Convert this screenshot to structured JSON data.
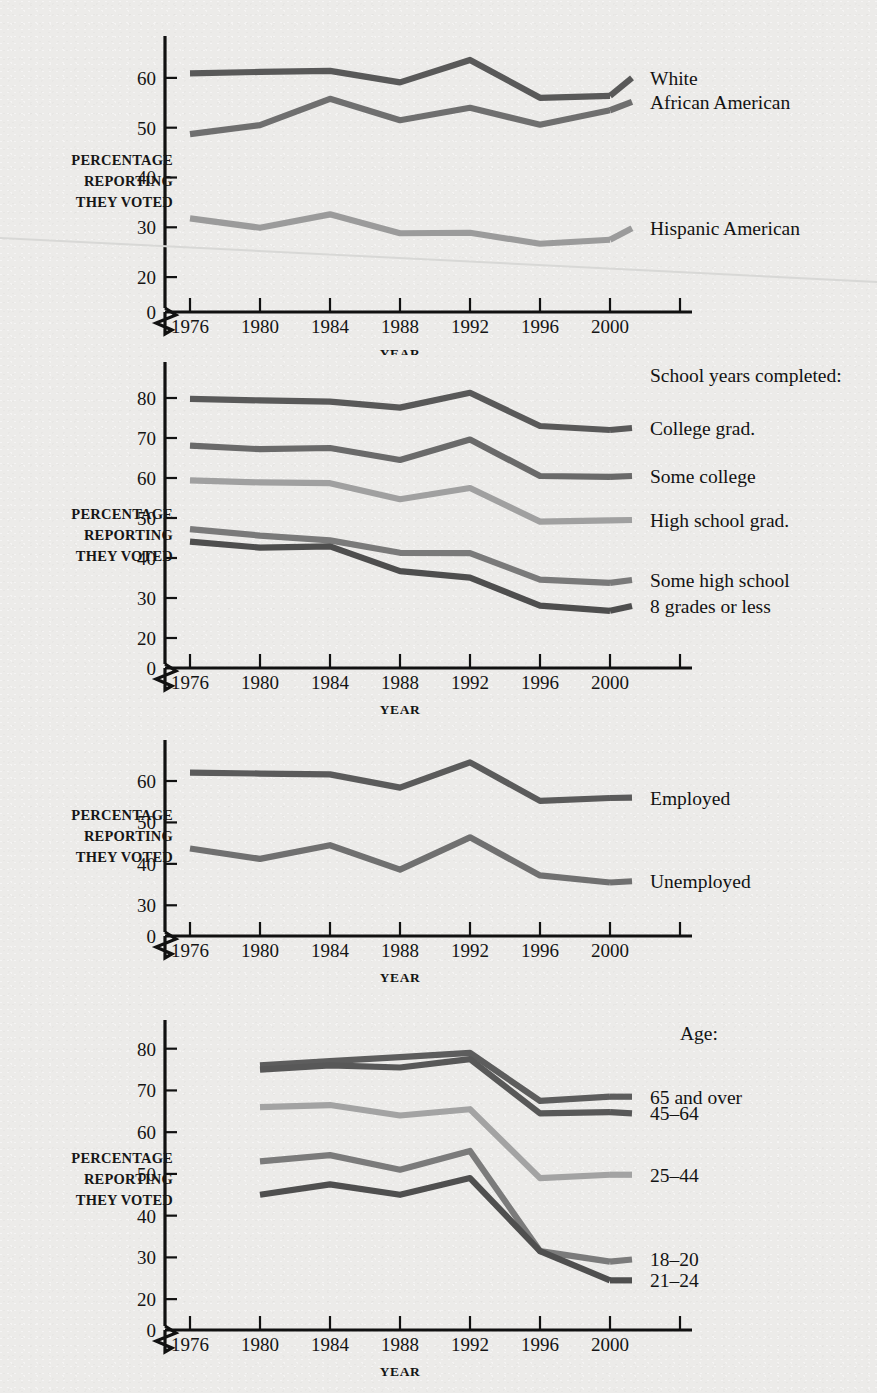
{
  "page": {
    "background_color": "#ecebe9",
    "axis_color": "#111111"
  },
  "common": {
    "y_axis_title_lines": [
      "PERCENTAGE",
      "REPORTING",
      "THEY VOTED"
    ],
    "x_axis_title": "YEAR",
    "zero_label": "0"
  },
  "palette": {
    "dark1": "#595959",
    "dark2": "#5e5e5e",
    "mid1": "#6f6f6f",
    "mid2": "#7d7d7d",
    "light1": "#9b9b9b",
    "light2": "#a6a6a6",
    "darkest": "#4a4a4a"
  },
  "charts": [
    {
      "id": "race-ethnicity",
      "x_ticks": [
        "1976",
        "1980",
        "1984",
        "1988",
        "1992",
        "1996",
        "2000"
      ],
      "y_ticks": [
        "20",
        "30",
        "40",
        "50",
        "60"
      ],
      "y_tick_values": [
        20,
        30,
        40,
        50,
        60
      ],
      "series": [
        {
          "name": "White",
          "color": "#595959",
          "label_y": 60,
          "values": [
            60.9,
            61.2,
            61.4,
            59.1,
            63.6,
            56.0,
            56.4
          ]
        },
        {
          "name": "African American",
          "color": "#6f6f6f",
          "label_y": 55.2,
          "values": [
            48.7,
            50.5,
            55.8,
            51.5,
            54.0,
            50.6,
            53.5
          ]
        },
        {
          "name": "Hispanic American",
          "color": "#9b9b9b",
          "label_y": 29.8,
          "values": [
            31.8,
            29.9,
            32.6,
            28.8,
            28.9,
            26.7,
            27.5
          ]
        }
      ]
    },
    {
      "id": "education",
      "legend_title": "School years completed:",
      "x_ticks": [
        "1976",
        "1980",
        "1984",
        "1988",
        "1992",
        "1996",
        "2000"
      ],
      "y_ticks": [
        "20",
        "30",
        "40",
        "50",
        "60",
        "70",
        "80"
      ],
      "y_tick_values": [
        20,
        30,
        40,
        50,
        60,
        70,
        80
      ],
      "series": [
        {
          "name": "College grad.",
          "color": "#595959",
          "label_y": 72.5,
          "values": [
            79.8,
            79.4,
            79.1,
            77.6,
            81.3,
            73.0,
            72.0
          ]
        },
        {
          "name": "Some college",
          "color": "#6a6a6a",
          "label_y": 60.5,
          "values": [
            68.1,
            67.2,
            67.5,
            64.5,
            69.6,
            60.5,
            60.3
          ]
        },
        {
          "name": "High school grad.",
          "color": "#a0a0a0",
          "label_y": 49.5,
          "values": [
            59.4,
            58.9,
            58.7,
            54.7,
            57.5,
            49.1,
            49.4
          ]
        },
        {
          "name": "Some high school",
          "color": "#7a7a7a",
          "label_y": 34.5,
          "values": [
            47.2,
            45.6,
            44.4,
            41.3,
            41.2,
            34.6,
            33.8
          ]
        },
        {
          "name": "8 grades or less",
          "color": "#4e4e4e",
          "label_y": 28.0,
          "values": [
            44.1,
            42.6,
            42.9,
            36.7,
            35.1,
            28.1,
            26.8
          ]
        }
      ]
    },
    {
      "id": "employment",
      "x_ticks": [
        "1976",
        "1980",
        "1984",
        "1988",
        "1992",
        "1996",
        "2000"
      ],
      "y_ticks": [
        "30",
        "40",
        "50",
        "60"
      ],
      "y_tick_values": [
        30,
        40,
        50,
        60
      ],
      "series": [
        {
          "name": "Employed",
          "color": "#5b5b5b",
          "label_y": 56.0,
          "values": [
            62.0,
            61.8,
            61.6,
            58.4,
            64.5,
            55.2,
            55.9
          ]
        },
        {
          "name": "Unemployed",
          "color": "#707070",
          "label_y": 35.8,
          "values": [
            43.7,
            41.2,
            44.5,
            38.6,
            46.4,
            37.2,
            35.5
          ]
        }
      ]
    },
    {
      "id": "age",
      "legend_title": "Age:",
      "x_ticks": [
        "1976",
        "1980",
        "1984",
        "1988",
        "1992",
        "1996",
        "2000"
      ],
      "y_ticks": [
        "20",
        "30",
        "40",
        "50",
        "60",
        "70",
        "80"
      ],
      "y_tick_values": [
        20,
        30,
        40,
        50,
        60,
        70,
        80
      ],
      "x_start_index": 1,
      "series": [
        {
          "name": "65 and over",
          "color": "#5d5d5d",
          "label_y": 68.5,
          "values": [
            null,
            76.0,
            77.0,
            78.0,
            79.0,
            67.5,
            68.5
          ]
        },
        {
          "name": "45–64",
          "color": "#585858",
          "label_y": 64.5,
          "values": [
            null,
            75.0,
            76.0,
            75.5,
            77.5,
            64.5,
            64.8
          ]
        },
        {
          "name": "25–44",
          "color": "#a3a3a3",
          "label_y": 49.8,
          "values": [
            null,
            66.0,
            66.5,
            64.0,
            65.5,
            49.0,
            49.8
          ]
        },
        {
          "name": "18–20",
          "color": "#7b7b7b",
          "label_y": 29.5,
          "values": [
            null,
            53.0,
            54.5,
            51.0,
            55.5,
            31.5,
            29.0
          ]
        },
        {
          "name": "21–24",
          "color": "#4f4f4f",
          "label_y": 24.5,
          "values": [
            null,
            45.0,
            47.5,
            45.0,
            49.0,
            31.5,
            24.5
          ]
        }
      ]
    }
  ]
}
